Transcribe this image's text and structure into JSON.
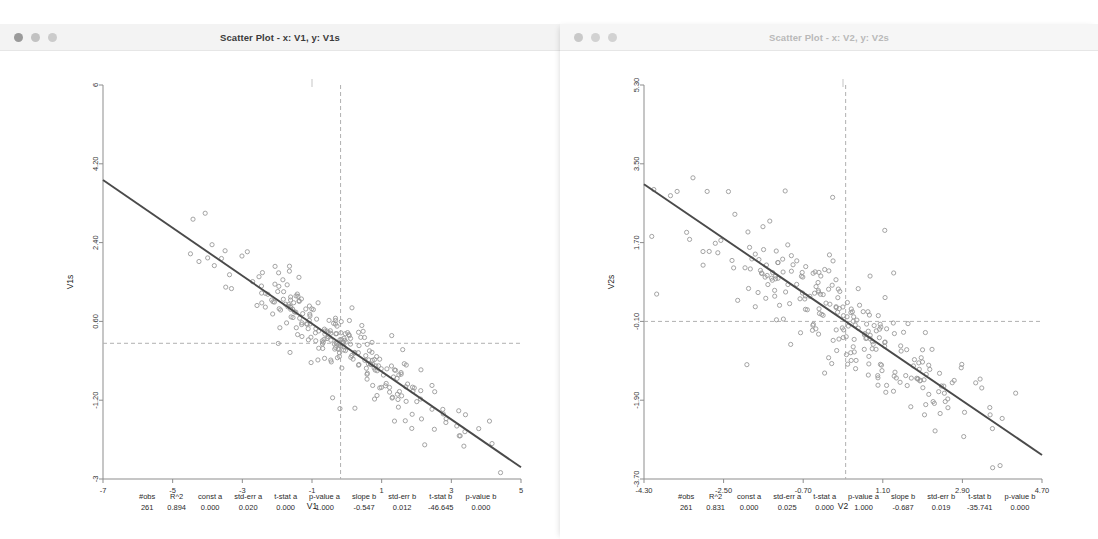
{
  "desktop": {
    "background_color": "#ffffff",
    "background_bars": [
      "window-edge-bar-1",
      "window-edge-bar-2"
    ]
  },
  "windows": [
    {
      "id": "left",
      "title": "Scatter Plot - x: V1, y: V1s",
      "controls": {
        "close": "close",
        "minimize": "minimize",
        "maximize": "maximize"
      },
      "focused": true
    },
    {
      "id": "right",
      "title": "Scatter Plot - x: V2, y: V2s",
      "controls": {
        "close": "close",
        "minimize": "minimize",
        "maximize": "maximize"
      },
      "focused": false
    }
  ],
  "stats_columns": [
    "#obs",
    "R^2",
    "const a",
    "std-err a",
    "t-stat a",
    "p-value a",
    "slope b",
    "std-err b",
    "t-stat b",
    "p-value b"
  ],
  "stats_left": [
    "261",
    "0.894",
    "0.000",
    "0.020",
    "0.000",
    "1.000",
    "-0.547",
    "0.012",
    "-46.645",
    "0.000"
  ],
  "stats_right": [
    "261",
    "0.831",
    "0.000",
    "0.025",
    "0.000",
    "1.000",
    "-0.687",
    "0.019",
    "-35.741",
    "0.000"
  ],
  "chart_data": [
    {
      "type": "scatter",
      "id": "left",
      "title": "Scatter Plot - x: V1, y: V1s",
      "xlabel": "V1",
      "ylabel": "V1s",
      "xlim": [
        -7,
        5
      ],
      "ylim": [
        -3,
        6
      ],
      "xticks": [
        -7,
        -5,
        -3,
        -1,
        1,
        3,
        5
      ],
      "xticklabels": [
        "-7",
        "-5",
        "-3",
        "-1",
        "1",
        "3",
        "5"
      ],
      "yticks": [
        -3,
        -1.2,
        0.6,
        2.4,
        4.2,
        6
      ],
      "yticklabels": [
        "-3",
        "-1.20",
        "0.60",
        "2.40",
        "4.20",
        "6"
      ],
      "grid": false,
      "legend": "none",
      "n_obs": 261,
      "r_squared": 0.894,
      "marker": "open-circle",
      "marker_color": "#9a9a9a",
      "fit_line": {
        "slope": -0.547,
        "intercept": 0.0,
        "color": "#4a4a4a",
        "style": "solid"
      },
      "mean_lines": {
        "x_mean": -0.18,
        "y_mean": 0.1,
        "color": "#b0b0b0",
        "style": "dashed"
      },
      "x_noise_sd": 1.75,
      "resid_sd": 0.33,
      "seed": 7391
    },
    {
      "type": "scatter",
      "id": "right",
      "title": "Scatter Plot - x: V2, y: V2s",
      "xlabel": "V2",
      "ylabel": "V2s",
      "xlim": [
        -4.3,
        4.7
      ],
      "ylim": [
        -3.7,
        5.3
      ],
      "xticks": [
        -4.3,
        -2.5,
        -0.7,
        1.1,
        2.9,
        4.7
      ],
      "xticklabels": [
        "-4.30",
        "-2.50",
        "-0.70",
        "1.10",
        "2.90",
        "4.70"
      ],
      "yticks": [
        -3.7,
        -1.9,
        -0.1,
        1.7,
        3.5,
        5.3
      ],
      "yticklabels": [
        "-3.70",
        "-1.90",
        "-0.10",
        "1.70",
        "3.50",
        "5.30"
      ],
      "grid": false,
      "legend": "none",
      "n_obs": 261,
      "r_squared": 0.831,
      "marker": "open-circle",
      "marker_color": "#9a9a9a",
      "fit_line": {
        "slope": -0.687,
        "intercept": 0.0,
        "color": "#4a4a4a",
        "style": "solid"
      },
      "mean_lines": {
        "x_mean": 0.26,
        "y_mean": -0.1,
        "color": "#b0b0b0",
        "style": "dashed"
      },
      "x_noise_sd": 1.55,
      "resid_sd": 0.52,
      "seed": 20411
    }
  ]
}
